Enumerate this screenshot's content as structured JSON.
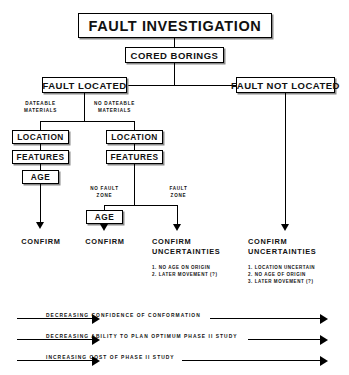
{
  "diagram": {
    "title": "FAULT INVESTIGATION",
    "nodes": {
      "title": "FAULT INVESTIGATION",
      "cored_borings": "CORED BORINGS",
      "fault_located": "FAULT  LOCATED",
      "fault_not_located": "FAULT NOT LOCATED",
      "location_left": "LOCATION",
      "features_left": "FEATURES",
      "age_left": "AGE",
      "location_mid": "LOCATION",
      "features_mid": "FEATURES",
      "age_mid": "AGE"
    },
    "branch_labels": {
      "dateable": [
        "DATEABLE",
        "MATERIALS"
      ],
      "no_dateable": [
        "NO DATEABLE",
        "MATERIALS"
      ],
      "no_fault_zone": [
        "NO FAULT",
        "ZONE"
      ],
      "fault_zone": [
        "FAULT",
        "ZONE"
      ]
    },
    "outcomes": [
      {
        "name": "outcome-confirm-left",
        "heading": "CONFIRM",
        "subheading": "",
        "items": []
      },
      {
        "name": "outcome-confirm-mid",
        "heading": "CONFIRM",
        "subheading": "",
        "items": []
      },
      {
        "name": "outcome-confirm-uncertainties-mid",
        "heading": "CONFIRM",
        "subheading": "UNCERTAINTIES",
        "items": [
          "1. NO AGE ON ORIGIN",
          "2. LATER MOVEMENT (?)"
        ]
      },
      {
        "name": "outcome-confirm-uncertainties-right",
        "heading": "CONFIRM",
        "subheading": "UNCERTAINTIES",
        "items": [
          "1. LOCATION UNCERTAIN",
          "2. NO AGE OF ORIGIN",
          "3. LATER MOVEMENT (?)"
        ]
      }
    ],
    "trend_bands": [
      "DECREASING CONFIDENCE OF CONFORMATION",
      "DECREASING ABILITY TO PLAN OPTIMUM PHASE II STUDY",
      "INCREASING COST OF PHASE II STUDY"
    ],
    "colors": {
      "line": "#000000",
      "background": "#ffffff",
      "text": "#111111"
    }
  }
}
